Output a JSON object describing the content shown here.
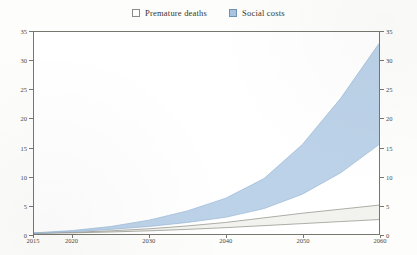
{
  "legend": {
    "position": "top-center",
    "items": [
      {
        "label": "Premature deaths",
        "icon": "legend-swatch-icon",
        "color": "#ffffff",
        "border": "#8a8a86"
      },
      {
        "label": "Social costs",
        "icon": "legend-swatch-icon",
        "color": "#a8c4e0",
        "border": "#6f91b5"
      }
    ]
  },
  "axes": {
    "y_left_ticks": [
      "0",
      "5",
      "10",
      "15",
      "20",
      "25",
      "30",
      "35"
    ],
    "y_right_ticks": [
      "0",
      "5",
      "10",
      "15",
      "20",
      "25",
      "30",
      "35"
    ],
    "x_ticks": [
      "2015",
      "2020",
      "2030",
      "2040",
      "2050",
      "2060"
    ]
  },
  "chart_data": {
    "type": "area",
    "title": "",
    "subtitle": "",
    "xlabel": "",
    "ylabel": "",
    "xlim": [
      2015,
      2060
    ],
    "ylim": [
      0,
      35
    ],
    "grid": false,
    "legend_position": "top-center",
    "x": [
      2015,
      2020,
      2025,
      2030,
      2035,
      2040,
      2045,
      2050,
      2055,
      2060
    ],
    "series": [
      {
        "name": "Premature deaths",
        "kind": "band",
        "fill": "#f2f2ef",
        "line": "#8c8c84",
        "upper": [
          0.15,
          0.3,
          0.55,
          0.9,
          1.4,
          2.0,
          2.8,
          3.6,
          4.3,
          5.0
        ],
        "lower": [
          0.1,
          0.2,
          0.35,
          0.55,
          0.8,
          1.1,
          1.45,
          1.8,
          2.15,
          2.5
        ]
      },
      {
        "name": "Social costs",
        "kind": "band",
        "fill": "#bcd2e8",
        "line": "#9ab8d6",
        "upper": [
          0.2,
          0.6,
          1.3,
          2.4,
          4.0,
          6.2,
          9.6,
          15.5,
          23.5,
          33.0
        ],
        "lower": [
          0.15,
          0.4,
          0.8,
          1.3,
          2.0,
          2.9,
          4.4,
          6.9,
          10.6,
          15.5
        ]
      }
    ],
    "y_ticks": [
      0,
      5,
      10,
      15,
      20,
      25,
      30,
      35
    ],
    "x_tick_labels": [
      "2015",
      "2020",
      "2030",
      "2040",
      "2050",
      "2060"
    ],
    "x_tick_values": [
      2015,
      2020,
      2030,
      2040,
      2050,
      2060
    ]
  }
}
